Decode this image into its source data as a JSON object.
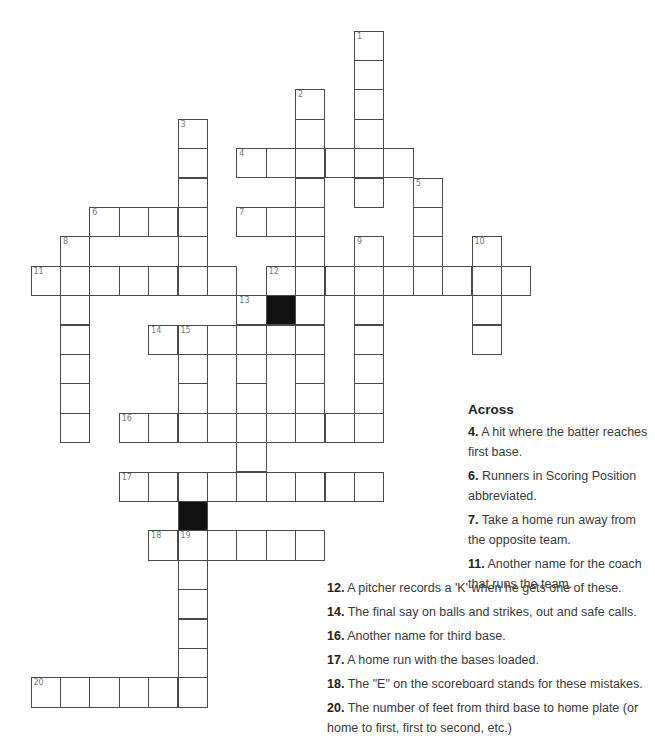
{
  "puzzle": {
    "cell_size": 29.4,
    "origin_x": 30.5,
    "origin_y": 30.5,
    "entries": [
      {
        "num": 1,
        "dir": "down",
        "row": 0,
        "col": 11,
        "len": 6
      },
      {
        "num": 2,
        "dir": "down",
        "row": 2,
        "col": 9,
        "len": 12
      },
      {
        "num": 3,
        "dir": "down",
        "row": 3,
        "col": 5,
        "len": 6
      },
      {
        "num": 4,
        "dir": "across",
        "row": 4,
        "col": 7,
        "len": 6
      },
      {
        "num": 5,
        "dir": "down",
        "row": 5,
        "col": 13,
        "len": 4
      },
      {
        "num": 6,
        "dir": "across",
        "row": 6,
        "col": 2,
        "len": 4
      },
      {
        "num": 7,
        "dir": "across",
        "row": 6,
        "col": 7,
        "len": 3
      },
      {
        "num": 8,
        "dir": "down",
        "row": 7,
        "col": 1,
        "len": 7
      },
      {
        "num": 9,
        "dir": "down",
        "row": 7,
        "col": 11,
        "len": 7
      },
      {
        "num": 10,
        "dir": "down",
        "row": 7,
        "col": 15,
        "len": 4
      },
      {
        "num": 11,
        "dir": "across",
        "row": 8,
        "col": 0,
        "len": 7
      },
      {
        "num": 12,
        "dir": "across",
        "row": 8,
        "col": 8,
        "len": 9
      },
      {
        "num": 13,
        "dir": "down",
        "row": 9,
        "col": 7,
        "len": 7
      },
      {
        "num": 14,
        "dir": "across",
        "row": 10,
        "col": 4,
        "len": 6
      },
      {
        "num": 15,
        "dir": "down",
        "row": 10,
        "col": 5,
        "len": 4
      },
      {
        "num": 16,
        "dir": "across",
        "row": 13,
        "col": 3,
        "len": 9
      },
      {
        "num": 17,
        "dir": "across",
        "row": 15,
        "col": 3,
        "len": 9
      },
      {
        "num": 18,
        "dir": "across",
        "row": 17,
        "col": 4,
        "len": 6
      },
      {
        "num": 19,
        "dir": "down",
        "row": 17,
        "col": 5,
        "len": 6
      },
      {
        "num": 20,
        "dir": "across",
        "row": 22,
        "col": 0,
        "len": 6
      }
    ],
    "black_cells": [
      {
        "row": 9,
        "col": 8
      },
      {
        "row": 16,
        "col": 5
      }
    ]
  },
  "clues": {
    "across_heading": "Across",
    "across": [
      {
        "num": "4.",
        "text": "A hit where the batter reaches first base."
      },
      {
        "num": "6.",
        "text": "Runners in Scoring Position abbreviated."
      },
      {
        "num": "7.",
        "text": "Take a home run away from the opposite team."
      },
      {
        "num": "11.",
        "text": "Another name for the coach that runs the team."
      },
      {
        "num": "12.",
        "text": "A pitcher records a 'K' when he gets one of these."
      },
      {
        "num": "14.",
        "text": "The final say on balls and strikes, out and safe calls."
      },
      {
        "num": "16.",
        "text": "Another name for third base."
      },
      {
        "num": "17.",
        "text": "A home run with the bases loaded."
      },
      {
        "num": "18.",
        "text": "The \"E\" on the scoreboard stands for these mistakes."
      },
      {
        "num": "20.",
        "text": "The number of feet from third base to home plate (or home to first, first to second, etc.)"
      }
    ]
  }
}
